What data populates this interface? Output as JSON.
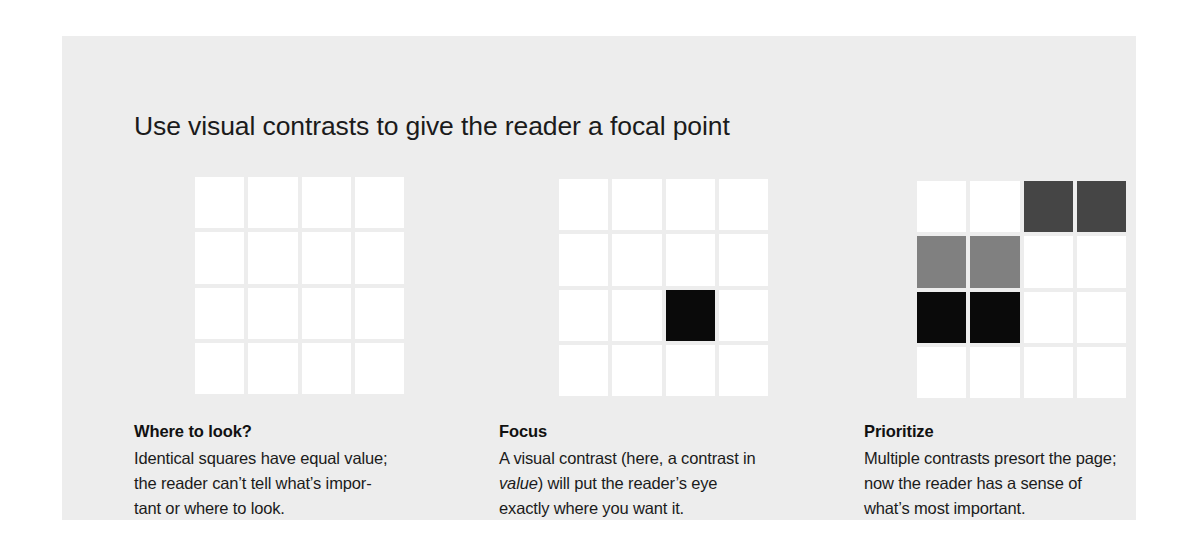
{
  "panel": {
    "background_color": "#ededed",
    "page_background_color": "#ffffff"
  },
  "title": "Use visual contrasts to give the reader a focal point",
  "colors": {
    "white": "#ffffff",
    "light_gray": "#808080",
    "dark_gray": "#454545",
    "black": "#0a0a0a",
    "text": "#1b1b1b"
  },
  "grids": [
    {
      "name": "grid-all-equal",
      "rows": 4,
      "cols": 4,
      "cells": [
        [
          "white",
          "white",
          "white",
          "white"
        ],
        [
          "white",
          "white",
          "white",
          "white"
        ],
        [
          "white",
          "white",
          "white",
          "white"
        ],
        [
          "white",
          "white",
          "white",
          "white"
        ]
      ]
    },
    {
      "name": "grid-single-focus",
      "rows": 4,
      "cols": 4,
      "cells": [
        [
          "white",
          "white",
          "white",
          "white"
        ],
        [
          "white",
          "white",
          "white",
          "white"
        ],
        [
          "white",
          "white",
          "black",
          "white"
        ],
        [
          "white",
          "white",
          "white",
          "white"
        ]
      ]
    },
    {
      "name": "grid-prioritized",
      "rows": 4,
      "cols": 4,
      "cells": [
        [
          "white",
          "white",
          "dark_gray",
          "dark_gray"
        ],
        [
          "light_gray",
          "light_gray",
          "white",
          "white"
        ],
        [
          "black",
          "black",
          "white",
          "white"
        ],
        [
          "white",
          "white",
          "white",
          "white"
        ]
      ]
    }
  ],
  "captions": [
    {
      "heading": "Where to look?",
      "lines": [
        {
          "text": "Identical squares have equal value;",
          "italic": false
        },
        {
          "text": "the reader can’t tell what’s impor-",
          "italic": false
        },
        {
          "text": "tant or where to look.",
          "italic": false
        }
      ]
    },
    {
      "heading": "Focus",
      "lines": [
        {
          "text": "A visual contrast (here, a contrast in",
          "italic": false
        },
        {
          "text": "value",
          "italic": true,
          "suffix": ") will put the reader’s eye"
        },
        {
          "text": "exactly where you want it.",
          "italic": false
        }
      ]
    },
    {
      "heading": "Prioritize",
      "lines": [
        {
          "text": "Multiple contrasts presort the page;",
          "italic": false
        },
        {
          "text": "now the reader has a sense of",
          "italic": false
        },
        {
          "text": "what’s most important.",
          "italic": false
        }
      ]
    }
  ]
}
